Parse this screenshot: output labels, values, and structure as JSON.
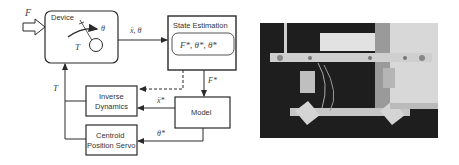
{
  "diagram": {
    "input_label": "F",
    "device": {
      "label": "Device",
      "torque_label": "T",
      "angle_label": "θ"
    },
    "edge_device_to_estimator": "ẍ, θ",
    "state_estimation": {
      "label": "State Estimation",
      "states": "F*, θ*, θ̇*"
    },
    "edge_estimator_to_model": "F*",
    "model": {
      "label": "Model"
    },
    "inverse_dynamics": {
      "line1": "Inverse",
      "line2": "Dynamics"
    },
    "centroid_servo": {
      "line1": "Centroid",
      "line2": "Position Servo"
    },
    "edge_model_to_inverse": "ẍ*",
    "edge_model_to_servo": "θ*",
    "feedback_label": "T"
  },
  "photo": {
    "description": "grayscale photograph of experimental device hardware"
  },
  "colors": {
    "line": "#2a2a2a",
    "text": "#333333",
    "photo_dark": "#1e1e1e",
    "photo_light": "#e6e6e6"
  }
}
